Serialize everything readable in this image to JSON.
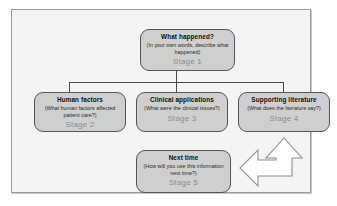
{
  "diagram": {
    "frame": {
      "border_color": "#9a9a9a",
      "background_color": "#f4f4f4"
    },
    "node_style": {
      "fill_color": "#cfcfcf",
      "border_color": "#555555",
      "title_color": "#111111",
      "stage_label_color": "#8d8d8d"
    },
    "nodes": [
      {
        "id": "stage-1",
        "title": "What happened?",
        "subtitle": "(In your own words, describe what happened)",
        "stage": "Stage 1"
      },
      {
        "id": "stage-2",
        "title": "Human factors",
        "subtitle": "(What human factors affected patient care?)",
        "stage": "Stage 2"
      },
      {
        "id": "stage-3",
        "title": "Clinical applications",
        "subtitle": "(What were the clinical issues?)",
        "stage": "Stage 3"
      },
      {
        "id": "stage-4",
        "title": "Supporting literature",
        "subtitle": "(What does the literature say?)",
        "stage": "Stage 4"
      },
      {
        "id": "stage-5",
        "title": "Next time",
        "subtitle": "(How will you use this information next time?)",
        "stage": "Stage 5"
      }
    ],
    "connectors": {
      "type": "orthogonal-tree",
      "from": "stage-1",
      "to": [
        "stage-2",
        "stage-3",
        "stage-4"
      ],
      "line_color": "#4a4a4a"
    },
    "arrow": {
      "name": "bent-double-headed-arrow",
      "direction": "up-and-left",
      "fill_color": "#ffffff",
      "outline_color": "#8f8f8f",
      "links": [
        "stage-4",
        "stage-5"
      ]
    }
  }
}
